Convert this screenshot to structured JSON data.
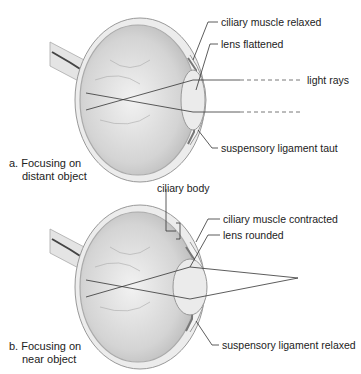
{
  "figure": {
    "panels": [
      {
        "id": "a",
        "caption_line1": "a. Focusing on",
        "caption_line2": "distant object",
        "labels": {
          "ciliary_muscle": "ciliary muscle relaxed",
          "lens": "lens flattened",
          "light_rays": "light rays",
          "suspensory_ligament": "suspensory ligament taut"
        }
      },
      {
        "id": "b",
        "caption_line1": "b. Focusing on",
        "caption_line2": "near object",
        "labels": {
          "ciliary_body": "ciliary body",
          "ciliary_muscle": "ciliary muscle contracted",
          "lens": "lens rounded",
          "suspensory_ligament": "suspensory ligament relaxed"
        }
      }
    ],
    "colors": {
      "line": "#333333",
      "eye_fill": "#d9d9d9",
      "sclera": "#eeeeee",
      "lens": "#e6e6e6"
    }
  }
}
